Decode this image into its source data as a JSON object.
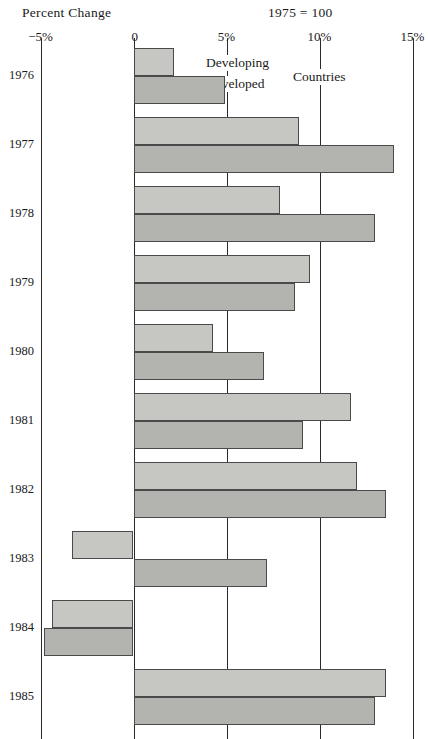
{
  "header": {
    "left_title": "Percent Change",
    "right_title": "1975 = 100"
  },
  "legend": {
    "developing": "Developing",
    "developed": "Developed",
    "countries": "Countries"
  },
  "axis": {
    "ticks": [
      "−5%",
      "0",
      "5%",
      "10%",
      "15%"
    ]
  },
  "chart_data": {
    "type": "bar",
    "orientation": "horizontal",
    "title": "Percent Change",
    "subtitle": "1975 = 100",
    "xlabel": "Percent Change",
    "ylabel": "",
    "xlim": [
      -5,
      15
    ],
    "xticks": [
      -5,
      0,
      5,
      10,
      15
    ],
    "xticklabels": [
      "−5%",
      "0",
      "5%",
      "10%",
      "15%"
    ],
    "grid": false,
    "legend_position": "inside-top",
    "categories": [
      "1976",
      "1977",
      "1978",
      "1979",
      "1980",
      "1981",
      "1982",
      "1983",
      "1984",
      "1985"
    ],
    "series": [
      {
        "name": "Developing Countries",
        "color": "#c6c6c3",
        "values": [
          2.2,
          8.9,
          7.9,
          9.5,
          4.3,
          11.7,
          12.0,
          -3.3,
          -4.4,
          13.6
        ]
      },
      {
        "name": "Developed Countries",
        "color": "#b3b3af",
        "values": [
          4.9,
          14.0,
          13.0,
          8.7,
          7.0,
          9.1,
          13.6,
          7.2,
          -4.8,
          13.0
        ]
      }
    ]
  }
}
